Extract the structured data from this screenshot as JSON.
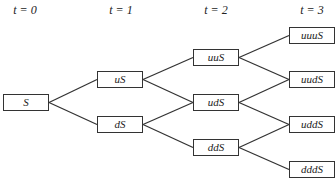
{
  "time_labels": [
    {
      "text": "t = 0",
      "x": 25
    },
    {
      "text": "t = 1",
      "x": 121
    },
    {
      "text": "t = 2",
      "x": 216
    },
    {
      "text": "t = 3",
      "x": 312
    }
  ],
  "nodes": [
    {
      "id": "S",
      "label": "S",
      "x": 3,
      "y": 94
    },
    {
      "id": "uS",
      "label": "uS",
      "x": 97,
      "y": 71
    },
    {
      "id": "dS",
      "label": "dS",
      "x": 97,
      "y": 116
    },
    {
      "id": "uuS",
      "label": "uuS",
      "x": 193,
      "y": 49
    },
    {
      "id": "udS",
      "label": "udS",
      "x": 193,
      "y": 94
    },
    {
      "id": "ddS",
      "label": "ddS",
      "x": 193,
      "y": 139
    },
    {
      "id": "uuuS",
      "label": "uuuS",
      "x": 289,
      "y": 27
    },
    {
      "id": "uudS",
      "label": "uudS",
      "x": 289,
      "y": 71
    },
    {
      "id": "uddS",
      "label": "uddS",
      "x": 289,
      "y": 116
    },
    {
      "id": "dddS",
      "label": "dddS",
      "x": 289,
      "y": 161
    }
  ],
  "edges": [
    [
      "S",
      "uS"
    ],
    [
      "S",
      "dS"
    ],
    [
      "uS",
      "uuS"
    ],
    [
      "uS",
      "udS"
    ],
    [
      "dS",
      "udS"
    ],
    [
      "dS",
      "ddS"
    ],
    [
      "uuS",
      "uuuS"
    ],
    [
      "uuS",
      "uudS"
    ],
    [
      "udS",
      "uudS"
    ],
    [
      "udS",
      "uddS"
    ],
    [
      "ddS",
      "uddS"
    ],
    [
      "ddS",
      "dddS"
    ]
  ]
}
